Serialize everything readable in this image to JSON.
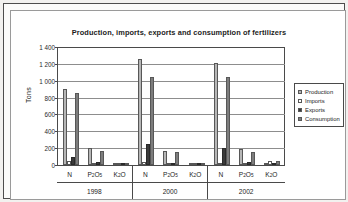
{
  "chart_data": {
    "type": "bar",
    "title": "Production, imports, exports and consumption of fertilizers",
    "xlabel": "",
    "ylabel": "Tons",
    "ylim": [
      0,
      1400
    ],
    "ytick_step": 200,
    "ytick_labels": [
      "1 400",
      "1 200",
      "1 000",
      "800",
      "600",
      "400",
      "200",
      "0"
    ],
    "ytick_values": [
      1400,
      1200,
      1000,
      800,
      600,
      400,
      200,
      0
    ],
    "grid": true,
    "legend_position": "right",
    "groups": [
      "1998",
      "2000",
      "2002"
    ],
    "categories": [
      "N",
      "P2O5",
      "K2O",
      "N",
      "P2O5",
      "K2O",
      "N",
      "P2O5",
      "K2O"
    ],
    "category_labels": [
      {
        "main": "N",
        "sub": ""
      },
      {
        "main": "P",
        "sub2": "2",
        "mid": "O",
        "sub5": "5"
      },
      {
        "main": "K",
        "sub2": "2",
        "mid": "O"
      }
    ],
    "series": [
      {
        "name": "Production",
        "color": "#b6b6b6",
        "values": [
          900,
          200,
          20,
          1260,
          165,
          20,
          1210,
          195,
          10
        ]
      },
      {
        "name": "Imports",
        "color": "#ffffff",
        "values": [
          50,
          5,
          20,
          40,
          10,
          20,
          25,
          10,
          50
        ]
      },
      {
        "name": "Exports",
        "color": "#3a3a3a",
        "values": [
          100,
          40,
          5,
          250,
          15,
          5,
          200,
          40,
          5
        ]
      },
      {
        "name": "Consumption",
        "color": "#7d7d7d",
        "values": [
          850,
          165,
          20,
          1050,
          150,
          20,
          1050,
          155,
          50
        ]
      }
    ]
  },
  "legend": {
    "items": [
      {
        "label": "Production"
      },
      {
        "label": "Imports"
      },
      {
        "label": "Exports"
      },
      {
        "label": "Consumption"
      }
    ]
  },
  "axis": {
    "y_title": "Tons",
    "years": [
      "1998",
      "2000",
      "2002"
    ]
  }
}
